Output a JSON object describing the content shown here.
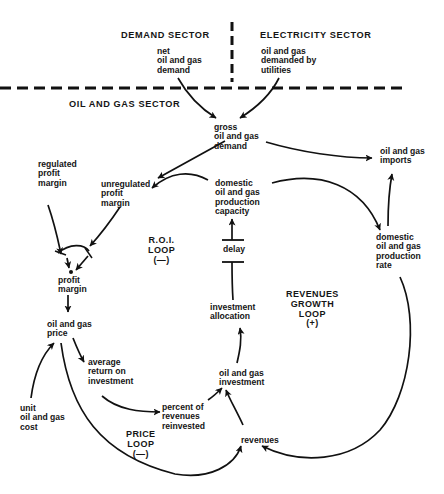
{
  "sectors": {
    "demand": "DEMAND SECTOR",
    "electricity": "ELECTRICITY SECTOR",
    "oil_gas": "OIL AND GAS SECTOR"
  },
  "variables": {
    "net_demand": "net\noil and gas\ndemand",
    "utility_demand": "oil and gas\ndemanded by\nutilities",
    "gross_demand": "gross\noil and gas\ndemand",
    "imports": "oil and gas\nimports",
    "regulated_margin": "regulated\nprofit\nmargin",
    "unregulated_margin": "unregulated\nprofit\nmargin",
    "production_capacity": "domestic\noil and gas\nproduction\ncapacity",
    "production_rate": "domestic\noil and gas\nproduction\nrate",
    "profit_margin": "profit\nmargin",
    "delay": "delay",
    "price": "oil and gas\nprice",
    "investment_allocation": "investment\nallocation",
    "avg_return": "average\nreturn on\ninvestment",
    "investment": "oil and gas\ninvestment",
    "unit_cost": "unit\noil and gas\ncost",
    "percent_reinvested": "percent of\nrevenues\nreinvested",
    "revenues": "revenues"
  },
  "loops": {
    "roi": "R.O.I.\nLOOP\n(—)",
    "revenues_growth": "REVENUES\nGROWTH\nLOOP\n(+)",
    "price": "PRICE\nLOOP\n(—)"
  }
}
